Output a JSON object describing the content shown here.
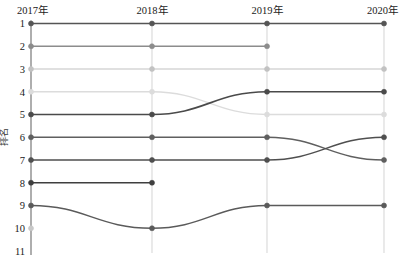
{
  "chart_data": {
    "type": "line",
    "subtype": "bump-rank-chart",
    "title": "",
    "xlabel": "",
    "ylabel": "排名",
    "categories": [
      "2017年",
      "2018年",
      "2019年",
      "2020年"
    ],
    "x_tick_labels": [
      "2017年",
      "2018年",
      "2019年",
      "2020年"
    ],
    "y_tick_labels": [
      "1",
      "2",
      "3",
      "4",
      "5",
      "6",
      "7",
      "8",
      "9",
      "10",
      "11"
    ],
    "ylim": [
      1,
      11
    ],
    "y_inverted": true,
    "grid": "vertical-only",
    "legend": "none",
    "series": [
      {
        "name": "series-rank-1",
        "color": "#555555",
        "width": 1.5,
        "values": [
          1,
          1,
          1,
          1
        ]
      },
      {
        "name": "series-rank-2",
        "color": "#8c8c8c",
        "width": 1.3,
        "values": [
          2,
          2,
          2,
          null
        ]
      },
      {
        "name": "series-rank-3",
        "color": "#c2c2c2",
        "width": 1.2,
        "values": [
          3,
          3,
          3,
          3
        ]
      },
      {
        "name": "series-rank-4",
        "color": "#dcdcdc",
        "width": 1.3,
        "values": [
          4,
          4,
          5,
          5
        ]
      },
      {
        "name": "series-rank-5",
        "color": "#4a4a4a",
        "width": 1.6,
        "values": [
          5,
          5,
          4,
          4
        ]
      },
      {
        "name": "series-rank-6",
        "color": "#5f5f5f",
        "width": 1.4,
        "values": [
          6,
          6,
          6,
          7
        ]
      },
      {
        "name": "series-rank-7",
        "color": "#4f4f4f",
        "width": 1.5,
        "values": [
          7,
          7,
          7,
          6
        ]
      },
      {
        "name": "series-rank-8",
        "color": "#3f3f3f",
        "width": 1.6,
        "values": [
          8,
          8,
          null,
          null
        ]
      },
      {
        "name": "series-rank-9",
        "color": "#5a5a5a",
        "width": 1.4,
        "values": [
          9,
          10,
          9,
          9
        ]
      },
      {
        "name": "series-rank-10",
        "color": "#c8c8c8",
        "width": 1.2,
        "values": [
          10,
          null,
          null,
          null
        ]
      }
    ]
  },
  "axes": {
    "x_positions": [
      31,
      152,
      267,
      384
    ],
    "y_axis_line_color": "#9a9a9a",
    "gridline_color": "#d8d8d8"
  }
}
